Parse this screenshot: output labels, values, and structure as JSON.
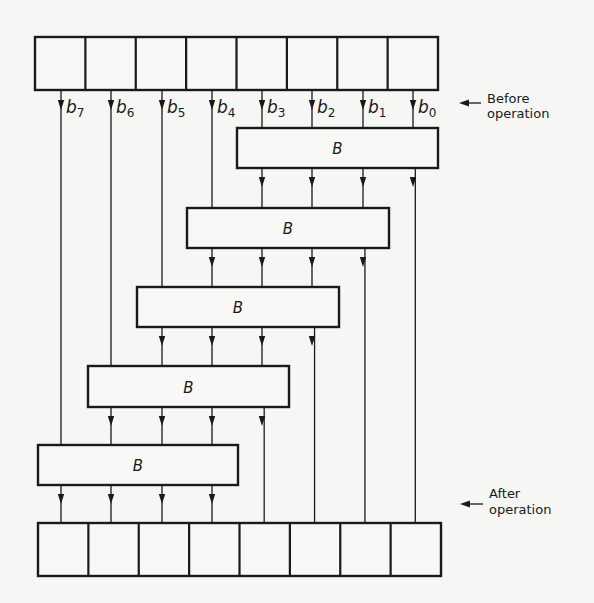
{
  "figure": {
    "top_register": {
      "x": 35,
      "y": 37,
      "width": 403,
      "height": 53,
      "cells": 8,
      "label": ""
    },
    "bottom_register": {
      "x": 38,
      "y": 523,
      "width": 403,
      "height": 53,
      "cells": 8,
      "label": ""
    },
    "bit_lines_x": [
      61,
      111,
      162,
      212,
      262,
      312,
      363,
      413
    ],
    "bit_labels": [
      {
        "letter": "b",
        "sub": "7"
      },
      {
        "letter": "b",
        "sub": "6"
      },
      {
        "letter": "b",
        "sub": "5"
      },
      {
        "letter": "b",
        "sub": "4"
      },
      {
        "letter": "b",
        "sub": "3"
      },
      {
        "letter": "b",
        "sub": "2"
      },
      {
        "letter": "b",
        "sub": "1"
      },
      {
        "letter": "b",
        "sub": "0"
      }
    ],
    "blocks": [
      {
        "label": "B",
        "x": 237,
        "y": 128,
        "width": 201,
        "height": 40,
        "bits": [
          4,
          5,
          6,
          7
        ]
      },
      {
        "label": "B",
        "x": 187,
        "y": 208,
        "width": 202,
        "height": 40,
        "bits": [
          3,
          4,
          5,
          6
        ]
      },
      {
        "label": "B",
        "x": 137,
        "y": 287,
        "width": 202,
        "height": 40,
        "bits": [
          2,
          3,
          4,
          5
        ]
      },
      {
        "label": "B",
        "x": 88,
        "y": 366,
        "width": 201,
        "height": 41,
        "bits": [
          1,
          2,
          3,
          4
        ]
      },
      {
        "label": "B",
        "x": 38,
        "y": 445,
        "width": 200,
        "height": 40,
        "bits": [
          0,
          1,
          2,
          3
        ]
      }
    ],
    "annotations": {
      "before": {
        "line1": "Before",
        "line2": "operation",
        "arrow_y": 103,
        "text_x": 487,
        "y1": 103,
        "y2": 118
      },
      "after": {
        "line1": "After",
        "line2": "operation",
        "arrow_y": 504,
        "text_x": 489,
        "y1": 498,
        "y2": 514
      }
    },
    "colors": {
      "ink": "#1a1a1a",
      "paper": "#f6f6f4"
    }
  }
}
